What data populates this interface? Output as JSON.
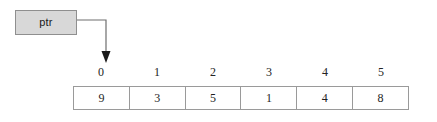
{
  "diagram": {
    "background_color": "#ffffff",
    "pointer": {
      "label": "ptr",
      "fill_color": "#d8d8d8",
      "border_color": "#8f8f8f"
    },
    "connector": {
      "name": "pointer-arrow",
      "stroke_color": "#6e6e6e",
      "points": "77,20 106,20 106,62",
      "arrow_tip": "106,62",
      "target_index": 0
    },
    "array": {
      "border_color": "#9a9a9a",
      "cell_background": "#ffffff",
      "indices": [
        "0",
        "1",
        "2",
        "3",
        "4",
        "5"
      ],
      "values": [
        "9",
        "3",
        "5",
        "1",
        "4",
        "8"
      ]
    }
  }
}
